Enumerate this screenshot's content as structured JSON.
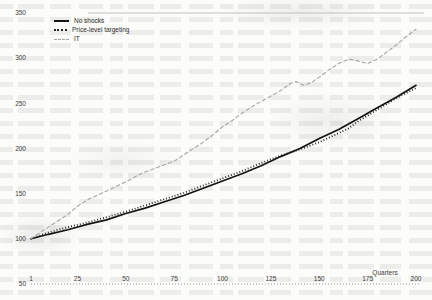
{
  "chart_data": {
    "type": "line",
    "title": "",
    "xlabel": "Quarters",
    "ylabel": "",
    "xlim": [
      1,
      200
    ],
    "ylim": [
      50,
      350
    ],
    "xticks": [
      1,
      25,
      50,
      75,
      100,
      125,
      150,
      175,
      200
    ],
    "yticks": [
      50,
      100,
      150,
      200,
      250,
      300,
      350
    ],
    "grid": "top border line at y=350 only; dotted baseline at y=50",
    "legend_position": "top-left",
    "series": [
      {
        "name": "No shocks",
        "style": "solid",
        "color": "#141414",
        "points": [
          [
            1,
            100
          ],
          [
            10,
            105
          ],
          [
            20,
            110
          ],
          [
            30,
            116
          ],
          [
            40,
            121
          ],
          [
            50,
            128
          ],
          [
            60,
            134
          ],
          [
            70,
            141
          ],
          [
            80,
            148
          ],
          [
            90,
            156
          ],
          [
            100,
            164
          ],
          [
            110,
            172
          ],
          [
            120,
            181
          ],
          [
            130,
            191
          ],
          [
            140,
            200
          ],
          [
            150,
            211
          ],
          [
            160,
            221
          ],
          [
            170,
            233
          ],
          [
            180,
            245
          ],
          [
            190,
            257
          ],
          [
            200,
            270
          ]
        ]
      },
      {
        "name": "Price-level targeting",
        "style": "dotted",
        "color": "#1a1a1a",
        "points": [
          [
            1,
            100
          ],
          [
            10,
            107
          ],
          [
            20,
            113
          ],
          [
            30,
            118
          ],
          [
            40,
            124
          ],
          [
            50,
            130
          ],
          [
            60,
            137
          ],
          [
            70,
            144
          ],
          [
            80,
            151
          ],
          [
            90,
            159
          ],
          [
            100,
            167
          ],
          [
            110,
            175
          ],
          [
            120,
            184
          ],
          [
            130,
            192
          ],
          [
            140,
            199
          ],
          [
            150,
            207
          ],
          [
            160,
            217
          ],
          [
            165,
            222
          ],
          [
            170,
            230
          ],
          [
            180,
            243
          ],
          [
            190,
            256
          ],
          [
            200,
            267
          ]
        ]
      },
      {
        "name": "IT",
        "style": "dashed",
        "color": "#a4a4a4",
        "points": [
          [
            1,
            100
          ],
          [
            5,
            106
          ],
          [
            10,
            113
          ],
          [
            15,
            120
          ],
          [
            20,
            127
          ],
          [
            25,
            136
          ],
          [
            30,
            143
          ],
          [
            35,
            148
          ],
          [
            40,
            153
          ],
          [
            45,
            158
          ],
          [
            50,
            163
          ],
          [
            55,
            169
          ],
          [
            60,
            174
          ],
          [
            65,
            178
          ],
          [
            70,
            182
          ],
          [
            75,
            186
          ],
          [
            80,
            193
          ],
          [
            85,
            200
          ],
          [
            90,
            207
          ],
          [
            95,
            215
          ],
          [
            100,
            224
          ],
          [
            105,
            231
          ],
          [
            110,
            239
          ],
          [
            115,
            246
          ],
          [
            120,
            252
          ],
          [
            125,
            258
          ],
          [
            130,
            264
          ],
          [
            135,
            272
          ],
          [
            138,
            274
          ],
          [
            142,
            270
          ],
          [
            146,
            273
          ],
          [
            150,
            279
          ],
          [
            155,
            287
          ],
          [
            160,
            294
          ],
          [
            165,
            299
          ],
          [
            170,
            297
          ],
          [
            175,
            294
          ],
          [
            180,
            299
          ],
          [
            185,
            307
          ],
          [
            190,
            315
          ],
          [
            195,
            324
          ],
          [
            200,
            332
          ]
        ]
      }
    ]
  }
}
